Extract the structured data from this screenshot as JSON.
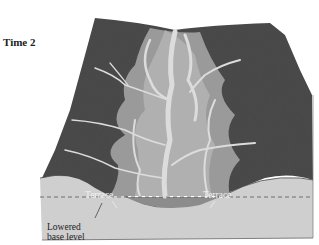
{
  "diagram": {
    "title": "Time 2",
    "labels": {
      "terrace_left": "Terrace",
      "terrace_right": "Terrace",
      "lowered_line1": "Lowered",
      "lowered_line2": "base level"
    },
    "colors": {
      "upland": "#4a4a4a",
      "valley_floor": "#9a9a9a",
      "terrace": "#b5b5b5",
      "streams": "#d9d9d9",
      "cross_section": "#cfcfcf",
      "channel_fill": "#8c8c8c",
      "base_level_line": "#555555"
    }
  }
}
